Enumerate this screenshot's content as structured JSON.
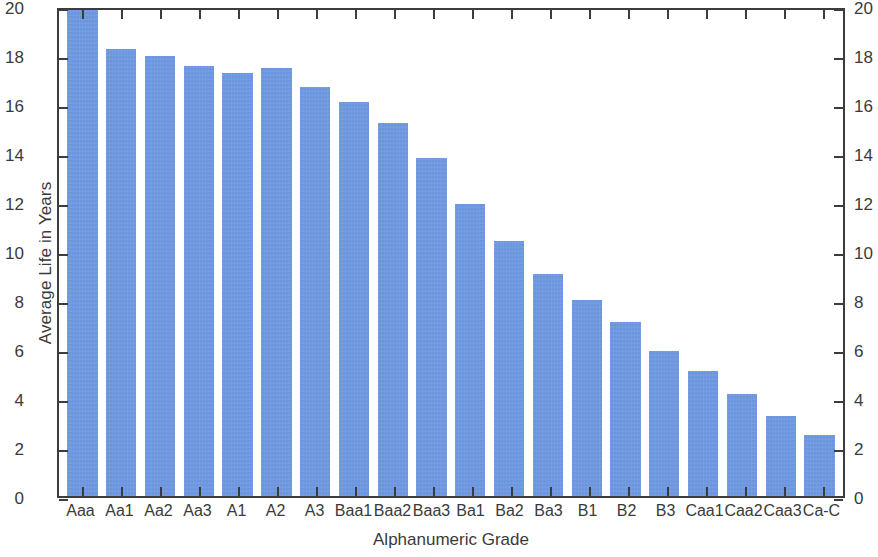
{
  "chart_data": {
    "type": "bar",
    "title": "",
    "xlabel": "Alphanumeric Grade",
    "ylabel": "Average Life in Years",
    "ylim": [
      0,
      20
    ],
    "ytick_step": 2,
    "grid": false,
    "legend": null,
    "bar_color": "#6f9ae4",
    "axis_color": "#3c3c3c",
    "dual_y_axis": true,
    "categories": [
      "Aaa",
      "Aa1",
      "Aa2",
      "Aa3",
      "A1",
      "A2",
      "A3",
      "Baa1",
      "Baa2",
      "Baa3",
      "Ba1",
      "Ba2",
      "Ba3",
      "B1",
      "B2",
      "B3",
      "Caa1",
      "Caa2",
      "Caa3",
      "Ca-C"
    ],
    "values": [
      20.0,
      18.4,
      18.1,
      17.7,
      17.4,
      17.6,
      16.85,
      16.2,
      15.35,
      13.9,
      12.0,
      10.5,
      9.15,
      8.05,
      7.15,
      5.95,
      5.15,
      4.2,
      3.3,
      2.5
    ],
    "yticks": [
      0,
      2,
      4,
      6,
      8,
      10,
      12,
      14,
      16,
      18,
      20
    ],
    "ytick_labels": [
      "0",
      "2",
      "4",
      "6",
      "8",
      "10",
      "12",
      "14",
      "16",
      "18",
      "20"
    ],
    "ytick_labels_right": [
      "0",
      "2",
      "4",
      "6",
      "8",
      "10",
      "12",
      "14",
      "16",
      "18",
      "20"
    ]
  }
}
